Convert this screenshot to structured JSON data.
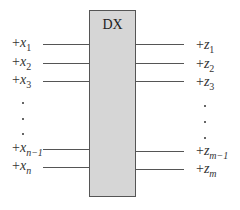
{
  "diagram": {
    "block": {
      "label": "DX",
      "fill": "#d6d6d6",
      "border": "#555555"
    },
    "inputs": [
      {
        "sign": "+",
        "var": "x",
        "sub": "1"
      },
      {
        "sign": "+",
        "var": "x",
        "sub": "2"
      },
      {
        "sign": "+",
        "var": "x",
        "sub": "3"
      },
      {
        "sign": "+",
        "var": "x",
        "sub": "n−1"
      },
      {
        "sign": "+",
        "var": "x",
        "sub": "n"
      }
    ],
    "outputs": [
      {
        "sign": "+",
        "var": "z",
        "sub": "1"
      },
      {
        "sign": "+",
        "var": "z",
        "sub": "2"
      },
      {
        "sign": "+",
        "var": "z",
        "sub": "3"
      },
      {
        "sign": "+",
        "var": "z",
        "sub": "m−1"
      },
      {
        "sign": "+",
        "var": "z",
        "sub": "m"
      }
    ],
    "ellipsis": "vertical dots"
  }
}
